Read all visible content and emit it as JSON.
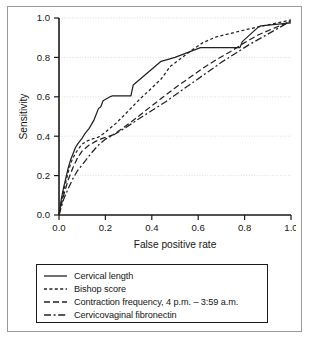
{
  "chart_data": {
    "type": "line",
    "title": "",
    "xlabel": "False positive rate",
    "ylabel": "Sensitivity",
    "xlim": [
      0.0,
      1.0
    ],
    "ylim": [
      0.0,
      1.0
    ],
    "xticks": [
      "0.0",
      "0.2",
      "0.4",
      "0.6",
      "0.8",
      "1.0"
    ],
    "xtick_values": [
      0.0,
      0.2,
      0.4,
      0.6,
      0.8,
      1.0
    ],
    "yticks": [
      "0.0",
      "0.2",
      "0.4",
      "0.6",
      "0.8",
      "1.0"
    ],
    "ytick_values": [
      0.0,
      0.2,
      0.4,
      0.6,
      0.8,
      1.0
    ],
    "grid": "horizontal-dotted",
    "legend_position": "below-plot",
    "series": [
      {
        "name": "Cervical length",
        "linestyle": "solid",
        "dasharray": "",
        "x": [
          0.0,
          0.01,
          0.02,
          0.03,
          0.04,
          0.05,
          0.06,
          0.07,
          0.08,
          0.1,
          0.11,
          0.13,
          0.15,
          0.16,
          0.17,
          0.18,
          0.19,
          0.22,
          0.23,
          0.31,
          0.32,
          0.43,
          0.44,
          0.5,
          0.61,
          0.62,
          0.78,
          0.79,
          0.86,
          0.87,
          1.0
        ],
        "y": [
          0.0,
          0.08,
          0.14,
          0.19,
          0.24,
          0.28,
          0.31,
          0.34,
          0.36,
          0.39,
          0.41,
          0.44,
          0.48,
          0.51,
          0.54,
          0.55,
          0.58,
          0.6,
          0.605,
          0.605,
          0.66,
          0.77,
          0.78,
          0.8,
          0.85,
          0.85,
          0.85,
          0.88,
          0.955,
          0.96,
          0.975
        ]
      },
      {
        "name": "Bishop score",
        "linestyle": "dotted",
        "dasharray": "3,2.4",
        "x": [
          0.0,
          0.01,
          0.02,
          0.03,
          0.04,
          0.05,
          0.06,
          0.08,
          0.1,
          0.12,
          0.14,
          0.17,
          0.2,
          0.25,
          0.3,
          0.35,
          0.4,
          0.44,
          0.48,
          0.52,
          0.57,
          0.62,
          0.68,
          0.75,
          0.82,
          0.88,
          0.94,
          1.0
        ],
        "y": [
          0.0,
          0.07,
          0.12,
          0.17,
          0.22,
          0.26,
          0.29,
          0.33,
          0.36,
          0.375,
          0.385,
          0.395,
          0.42,
          0.47,
          0.53,
          0.59,
          0.645,
          0.69,
          0.755,
          0.79,
          0.835,
          0.875,
          0.905,
          0.925,
          0.945,
          0.96,
          0.975,
          0.99
        ]
      },
      {
        "name": "Contraction frequency, 4 p.m. – 3:59 a.m.",
        "linestyle": "dashed",
        "dasharray": "6,3",
        "x": [
          0.0,
          0.01,
          0.02,
          0.03,
          0.04,
          0.06,
          0.08,
          0.1,
          0.13,
          0.16,
          0.19,
          0.23,
          0.28,
          0.33,
          0.39,
          0.45,
          0.5,
          0.56,
          0.62,
          0.68,
          0.74,
          0.8,
          0.86,
          0.92,
          1.0
        ],
        "y": [
          0.0,
          0.05,
          0.1,
          0.14,
          0.18,
          0.24,
          0.29,
          0.325,
          0.355,
          0.375,
          0.39,
          0.405,
          0.445,
          0.49,
          0.545,
          0.6,
          0.645,
          0.695,
          0.745,
          0.79,
          0.83,
          0.875,
          0.915,
          0.945,
          0.985
        ]
      },
      {
        "name": "Cervicovaginal fibronectin",
        "linestyle": "dashdot",
        "dasharray": "7,2.6,2,2.6",
        "x": [
          0.0,
          0.01,
          0.02,
          0.04,
          0.06,
          0.08,
          0.11,
          0.14,
          0.17,
          0.2,
          0.24,
          0.29,
          0.34,
          0.4,
          0.46,
          0.52,
          0.58,
          0.64,
          0.7,
          0.76,
          0.82,
          0.88,
          0.94,
          1.0
        ],
        "y": [
          0.0,
          0.04,
          0.08,
          0.135,
          0.185,
          0.225,
          0.27,
          0.315,
          0.355,
          0.385,
          0.41,
          0.445,
          0.485,
          0.53,
          0.575,
          0.625,
          0.675,
          0.725,
          0.775,
          0.82,
          0.865,
          0.905,
          0.945,
          0.985
        ]
      }
    ]
  },
  "legend": {
    "items": [
      {
        "label": "Cervical length"
      },
      {
        "label": "Bishop score"
      },
      {
        "label": "Contraction frequency, 4 p.m. – 3:59 a.m."
      },
      {
        "label": "Cervicovaginal fibronectin"
      }
    ]
  },
  "colors": {
    "line": "#222222",
    "axis": "#1a1a1a",
    "grid": "#cfcfcf",
    "frame": "#9a9a9a",
    "background": "#ffffff"
  }
}
